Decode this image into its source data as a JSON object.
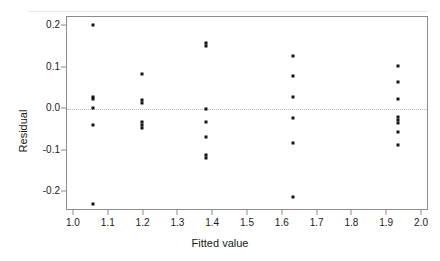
{
  "figure": {
    "background_color": "#ffffff",
    "point_color": "#141414",
    "frame_color": "#8c8c8c",
    "zero_line_color": "#b9b9b9"
  },
  "chart_data": {
    "type": "scatter",
    "title": "",
    "xlabel": "Fitted value",
    "ylabel": "Residual",
    "xlim": [
      0.98,
      2.02
    ],
    "ylim": [
      -0.245,
      0.222
    ],
    "grid": false,
    "legend": null,
    "reference_lines": [
      {
        "orientation": "horizontal",
        "value": 0.0,
        "style": "dotted",
        "color": "#b9b9b9"
      }
    ],
    "xticks": [
      1.0,
      1.1,
      1.2,
      1.3,
      1.4,
      1.5,
      1.6,
      1.7,
      1.8,
      1.9,
      2.0
    ],
    "xtick_labels": [
      "1.0",
      "1.1",
      "1.2",
      "1.3",
      "1.4",
      "1.5",
      "1.6",
      "1.7",
      "1.8",
      "1.9",
      "2.0"
    ],
    "yticks": [
      0.2,
      0.1,
      0.0,
      -0.1,
      -0.2
    ],
    "ytick_labels": [
      "0.2",
      "0.1",
      "0.0",
      "-0.1",
      "-0.2"
    ],
    "x": [
      1.055,
      1.055,
      1.055,
      1.055,
      1.055,
      1.055,
      1.195,
      1.195,
      1.195,
      1.195,
      1.195,
      1.195,
      1.378,
      1.378,
      1.378,
      1.378,
      1.378,
      1.378,
      1.378,
      1.628,
      1.628,
      1.628,
      1.628,
      1.628,
      1.628,
      1.932,
      1.932,
      1.932,
      1.932,
      1.932,
      1.932,
      1.932,
      1.932
    ],
    "y": [
      0.203,
      0.03,
      0.024,
      0.003,
      -0.037,
      -0.228,
      0.085,
      0.023,
      0.016,
      -0.03,
      -0.038,
      -0.046,
      0.16,
      0.153,
      0.001,
      -0.03,
      -0.068,
      -0.111,
      -0.118,
      0.128,
      0.079,
      0.029,
      -0.02,
      -0.081,
      -0.211,
      0.104,
      0.065,
      0.024,
      -0.018,
      -0.025,
      -0.032,
      -0.055,
      -0.085
    ],
    "groups": [
      {
        "fitted_value": 1.055,
        "residuals": [
          0.203,
          0.03,
          0.024,
          0.003,
          -0.037,
          -0.228
        ]
      },
      {
        "fitted_value": 1.195,
        "residuals": [
          0.085,
          0.023,
          0.016,
          -0.03,
          -0.038,
          -0.046
        ]
      },
      {
        "fitted_value": 1.378,
        "residuals": [
          0.16,
          0.153,
          0.001,
          -0.03,
          -0.068,
          -0.111,
          -0.118
        ]
      },
      {
        "fitted_value": 1.628,
        "residuals": [
          0.128,
          0.079,
          0.029,
          -0.02,
          -0.081,
          -0.211
        ]
      },
      {
        "fitted_value": 1.932,
        "residuals": [
          0.104,
          0.065,
          0.024,
          -0.018,
          -0.025,
          -0.032,
          -0.055,
          -0.085
        ]
      }
    ]
  }
}
